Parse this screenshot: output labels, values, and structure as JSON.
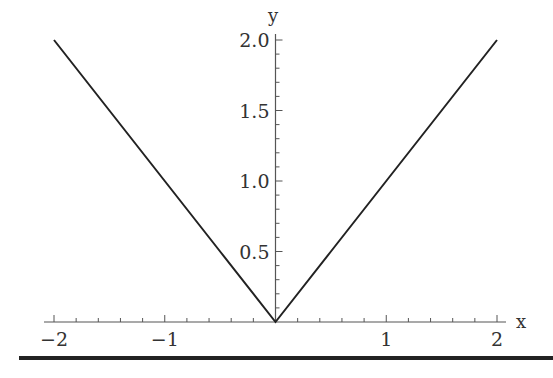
{
  "chart_data": {
    "type": "line",
    "title": "",
    "function": "y = |x|",
    "xlabel": "x",
    "ylabel": "y",
    "xlim": [
      -2,
      2
    ],
    "ylim": [
      0,
      2
    ],
    "grid": false,
    "legend": null,
    "x_ticks": [
      {
        "value": -2,
        "label": "−2"
      },
      {
        "value": -1,
        "label": "−1"
      },
      {
        "value": 1,
        "label": "1"
      },
      {
        "value": 2,
        "label": "2"
      }
    ],
    "y_ticks": [
      {
        "value": 0.5,
        "label": "0.5"
      },
      {
        "value": 1.0,
        "label": "1.0"
      },
      {
        "value": 1.5,
        "label": "1.5"
      },
      {
        "value": 2.0,
        "label": "2.0"
      }
    ],
    "x_minor_step": 0.2,
    "y_minor_step": 0.1,
    "series": [
      {
        "name": "|x|",
        "color": "#222222",
        "x": [
          -2,
          -1.5,
          -1,
          -0.5,
          0,
          0.5,
          1,
          1.5,
          2
        ],
        "y": [
          2,
          1.5,
          1,
          0.5,
          0,
          0.5,
          1,
          1.5,
          2
        ]
      }
    ]
  },
  "colors": {
    "axis": "#555555",
    "line": "#222222",
    "text": "#333333",
    "rule": "#222222"
  }
}
